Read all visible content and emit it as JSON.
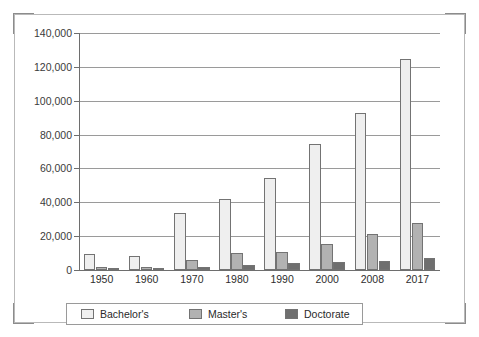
{
  "chart_data": {
    "type": "bar",
    "title": "",
    "subtitle": "",
    "xlabel": "",
    "ylabel": "",
    "categories": [
      "1950",
      "1960",
      "1970",
      "1980",
      "1990",
      "2000",
      "2008",
      "2017"
    ],
    "series": [
      {
        "name": "Bachelor's",
        "color": "#efefef",
        "values": [
          9700,
          8000,
          33700,
          41800,
          54100,
          74200,
          92900,
          124600
        ]
      },
      {
        "name": "Master's",
        "color": "#b2b2b2",
        "values": [
          1600,
          1500,
          5800,
          10200,
          10800,
          15300,
          21300,
          27900
        ]
      },
      {
        "name": "Doctorate",
        "color": "#6f6f6f",
        "values": [
          600,
          500,
          1700,
          3000,
          3900,
          4800,
          5300,
          7000
        ]
      }
    ],
    "ylim": [
      0,
      140000
    ],
    "ytick_values": [
      0,
      20000,
      40000,
      60000,
      80000,
      100000,
      120000,
      140000
    ],
    "ytick_labels": [
      "0",
      "20,000",
      "40,000",
      "60,000",
      "80,000",
      "100,000",
      "120,000",
      "140,000"
    ],
    "grid": true,
    "legend_position": "bottom"
  },
  "legend": {
    "items": [
      {
        "label": "Bachelor's",
        "swatch": "bachelors-swatch"
      },
      {
        "label": "Master's",
        "swatch": "masters-swatch"
      },
      {
        "label": "Doctorate",
        "swatch": "doctorate-swatch"
      }
    ]
  },
  "colors": {
    "bachelors": "#efefef",
    "masters": "#b2b2b2",
    "doctorate": "#6f6f6f",
    "grid": "#9a9a9a",
    "axis": "#6e6e6e",
    "frame": "#b9b9b9",
    "cropmark": "#8c8c8c",
    "text": "#2d2d2d"
  }
}
